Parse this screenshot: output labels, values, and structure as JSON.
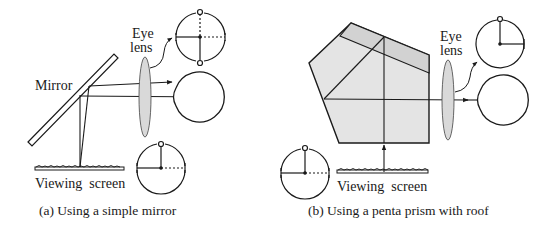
{
  "panel_a": {
    "labels": {
      "eye_lens_line1": "Eye",
      "eye_lens_line2": "lens",
      "mirror": "Mirror",
      "viewing_screen": "Viewing  screen"
    },
    "caption": "(a) Using a simple mirror"
  },
  "panel_b": {
    "labels": {
      "eye_lens_line1": "Eye",
      "eye_lens_line2": "lens",
      "viewing_screen": "Viewing  screen"
    },
    "caption": "(b) Using a penta prism with roof"
  },
  "colors": {
    "line": "#1a1a1a",
    "lens_fill": "#d9d9d9",
    "prism_fill": "#e4e4e4",
    "roof_fill": "#d2d2d2",
    "background": "#ffffff"
  }
}
